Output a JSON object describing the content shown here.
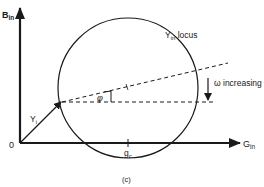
{
  "figure": {
    "caption": "(c)",
    "axes": {
      "y_axis": {
        "label_main": "B",
        "label_sub": "in"
      },
      "x_axis": {
        "label_main": "G",
        "label_sub": "in"
      },
      "origin_label": "0"
    },
    "locus": {
      "label_main": "Y",
      "label_sub": "in",
      "label_rest": " locus",
      "shape": "circle"
    },
    "phasor": {
      "label_main": "Y",
      "label_sub": "i"
    },
    "angle": {
      "label": "φ"
    },
    "direction_note": {
      "symbol": "ω",
      "text": " increasing"
    },
    "center_tick": {
      "label_main": "g",
      "label_sub": "c"
    }
  },
  "colors": {
    "ink": "#1a1a1a",
    "background": "#ffffff"
  }
}
